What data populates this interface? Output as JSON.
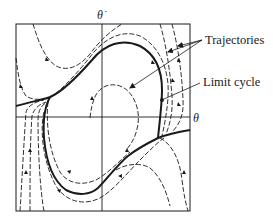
{
  "figure": {
    "type": "phase-portrait",
    "axes": {
      "x_label": "θ",
      "y_label": "θ̇"
    },
    "annotations": [
      {
        "id": "trajectories",
        "text": "Trajectories"
      },
      {
        "id": "limit_cycle",
        "text": "Limit cycle"
      }
    ],
    "colors": {
      "ink": "#1a1a1a",
      "background": "#ffffff"
    }
  }
}
